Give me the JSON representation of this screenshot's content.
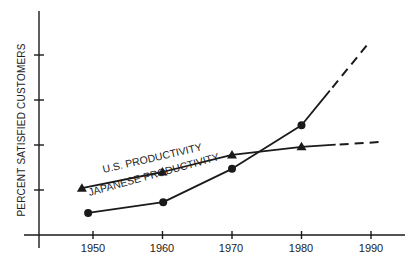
{
  "chart_data": {
    "type": "line",
    "title": "",
    "xlabel": "",
    "ylabel": "PERCENT SATISFIED CUSTOMERS",
    "x_ticks": [
      1950,
      1960,
      1970,
      1980,
      1990
    ],
    "xlim": [
      1946,
      1995
    ],
    "ylim": [
      0,
      5
    ],
    "y_ticks_unlabeled": [
      1,
      2,
      3,
      4
    ],
    "grid": false,
    "legend": "inline labels along lines",
    "series": [
      {
        "name": "U.S. PRODUCTIVITY",
        "marker": "triangle",
        "points": [
          {
            "x": 1948.4,
            "y": 1.04
          },
          {
            "x": 1960.0,
            "y": 1.4
          },
          {
            "x": 1970.0,
            "y": 1.78
          },
          {
            "x": 1980.0,
            "y": 1.96
          }
        ],
        "projection": [
          {
            "x": 1980.0,
            "y": 1.96
          },
          {
            "x": 1991.7,
            "y": 2.07
          }
        ]
      },
      {
        "name": "JAPANESE PRODUCTIVITY",
        "marker": "circle",
        "points": [
          {
            "x": 1949.3,
            "y": 0.49
          },
          {
            "x": 1960.1,
            "y": 0.73
          },
          {
            "x": 1970.0,
            "y": 1.47
          },
          {
            "x": 1980.0,
            "y": 2.44
          }
        ],
        "projection": [
          {
            "x": 1980.0,
            "y": 2.44
          },
          {
            "x": 1989.7,
            "y": 4.27
          }
        ]
      }
    ]
  },
  "labels": {
    "ylabel": "PERCENT SATISFIED CUSTOMERS",
    "xticks": [
      "1950",
      "1960",
      "1970",
      "1980",
      "1990"
    ],
    "us_series": "U.S. PRODUCTIVITY",
    "jp_series": "JAPANESE PRODUCTIVITY"
  }
}
